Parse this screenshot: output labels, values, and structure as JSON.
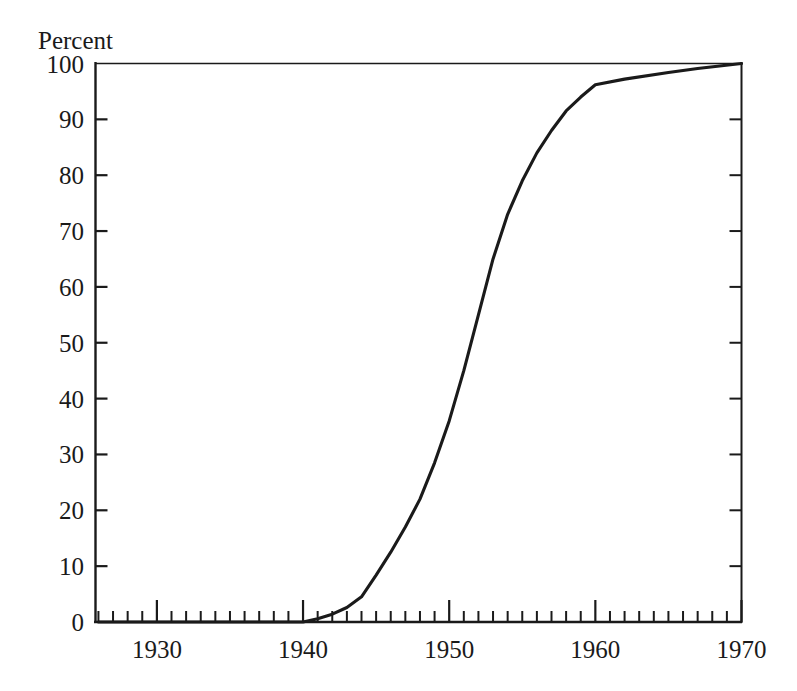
{
  "chart_data": {
    "type": "line",
    "title": "",
    "ylabel": "Percent",
    "xlabel": "",
    "xlim": [
      1925.8,
      1970
    ],
    "ylim": [
      0,
      100
    ],
    "grid": false,
    "legend": null,
    "x_major_ticks": [
      1930,
      1940,
      1950,
      1960,
      1970
    ],
    "x_major_tick_labels": [
      "1930",
      "1940",
      "1950",
      "1960",
      "1970"
    ],
    "x_minor_tick_step": 1,
    "y_ticks": [
      0,
      10,
      20,
      30,
      40,
      50,
      60,
      70,
      80,
      90,
      100
    ],
    "y_tick_labels": [
      "0",
      "10",
      "20",
      "30",
      "40",
      "50",
      "60",
      "70",
      "80",
      "90",
      "100"
    ],
    "series": [
      {
        "name": "Percent",
        "color": "#1a1a1a",
        "x": [
          1926,
          1930,
          1935,
          1938,
          1940,
          1941,
          1942,
          1943,
          1944,
          1945,
          1946,
          1947,
          1948,
          1949,
          1950,
          1951,
          1952,
          1953,
          1954,
          1955,
          1956,
          1957,
          1958,
          1959,
          1960,
          1962,
          1965,
          1967,
          1970
        ],
        "values": [
          0,
          0,
          0,
          0,
          0,
          0.6,
          1.4,
          2.6,
          4.5,
          8.4,
          12.5,
          17,
          22,
          28.5,
          36,
          45,
          55,
          65,
          73,
          79,
          84,
          88,
          91.5,
          94,
          96.2,
          97.2,
          98.4,
          99.1,
          100
        ]
      }
    ]
  },
  "axes": {
    "y_axis_label_text": "Percent",
    "line_color": "#1a1a1a",
    "background_color": "#ffffff"
  }
}
